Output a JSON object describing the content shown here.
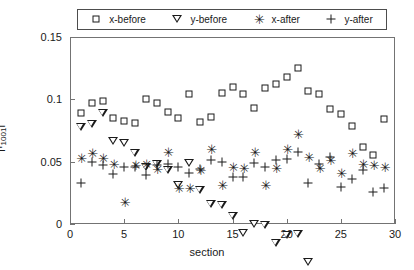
{
  "chart_data": {
    "type": "scatter",
    "title": "",
    "xlabel": "section",
    "ylabel": "|f_1001|",
    "ylabel_base": "|f",
    "ylabel_sub": "1001",
    "ylabel_tail": "|",
    "xlim": [
      0,
      30
    ],
    "ylim": [
      0,
      0.15
    ],
    "xticks": [
      0,
      5,
      10,
      15,
      20,
      25,
      30
    ],
    "yticks": [
      0,
      0.05,
      0.1,
      0.15
    ],
    "xtick_labels": [
      "0",
      "5",
      "10",
      "15",
      "20",
      "25",
      "30"
    ],
    "ytick_labels": [
      "0",
      "0.05",
      "0.1",
      "0.15"
    ],
    "grid": false,
    "legend_position": "top-outside",
    "marker_color": "#1a1a1a",
    "series": [
      {
        "name": "x-before",
        "marker": "square",
        "x": [
          1,
          2,
          3,
          4,
          5,
          6,
          7,
          8,
          9,
          10,
          11,
          12,
          13,
          14,
          15,
          16,
          17,
          18,
          19,
          20,
          21,
          22,
          23,
          24,
          25,
          26,
          27,
          28,
          29
        ],
        "y": [
          0.089,
          0.097,
          0.099,
          0.085,
          0.083,
          0.081,
          0.1,
          0.097,
          0.09,
          0.085,
          0.104,
          0.082,
          0.086,
          0.105,
          0.11,
          0.104,
          0.093,
          0.109,
          0.112,
          0.118,
          0.125,
          0.107,
          0.104,
          0.092,
          0.088,
          0.079,
          0.062,
          0.055,
          0.084
        ]
      },
      {
        "name": "y-before",
        "marker": "triangle-down",
        "x": [
          1,
          2,
          3,
          4,
          5,
          6,
          7,
          8,
          9,
          10,
          11,
          12,
          13,
          14,
          15,
          16,
          17,
          18,
          19,
          20,
          21,
          22,
          23,
          24,
          25,
          26,
          27,
          28,
          29
        ],
        "y": [
          0.078,
          0.087,
          0.102,
          0.086,
          0.091,
          0.089,
          0.084,
          0.093,
          0.095,
          0.089,
          0.113,
          0.098,
          0.093,
          0.099,
          0.096,
          0.089,
          0.103,
          0.108,
          0.1,
          0.113,
          0.12,
          0.104,
          0.1,
          0.098,
          0.096,
          0.088,
          0.073,
          0.054,
          0.082
        ]
      },
      {
        "name": "x-after",
        "marker": "asterisk",
        "x": [
          1,
          2,
          3,
          4,
          5,
          6,
          7,
          8,
          9,
          10,
          11,
          12,
          13,
          14,
          15,
          16,
          17,
          18,
          19,
          20,
          21,
          22,
          23,
          24,
          25,
          26,
          27,
          28,
          29
        ],
        "y": [
          0.053,
          0.057,
          0.053,
          0.048,
          0.018,
          0.047,
          0.048,
          0.044,
          0.058,
          0.029,
          0.029,
          0.043,
          0.06,
          0.031,
          0.046,
          0.045,
          0.058,
          0.031,
          0.045,
          0.06,
          0.072,
          0.054,
          0.045,
          0.051,
          0.041,
          0.057,
          0.048,
          0.047,
          0.046
        ]
      },
      {
        "name": "y-after",
        "marker": "plus",
        "x": [
          1,
          2,
          3,
          4,
          5,
          6,
          7,
          8,
          9,
          10,
          11,
          12,
          13,
          14,
          15,
          16,
          17,
          18,
          19,
          20,
          21,
          22,
          23,
          24,
          25,
          26,
          27,
          28,
          29
        ],
        "y": [
          0.033,
          0.05,
          0.047,
          0.04,
          0.046,
          0.046,
          0.039,
          0.047,
          0.048,
          0.046,
          0.041,
          0.044,
          0.051,
          0.05,
          0.038,
          0.038,
          0.049,
          0.046,
          0.051,
          0.052,
          0.058,
          0.033,
          0.048,
          0.054,
          0.03,
          0.036,
          0.043,
          0.026,
          0.029
        ]
      }
    ]
  },
  "legend": {
    "entries": [
      {
        "label": "x-before",
        "marker": "square"
      },
      {
        "label": "y-before",
        "marker": "triangle-down"
      },
      {
        "label": "x-after",
        "marker": "asterisk"
      },
      {
        "label": "y-after",
        "marker": "plus"
      }
    ]
  }
}
